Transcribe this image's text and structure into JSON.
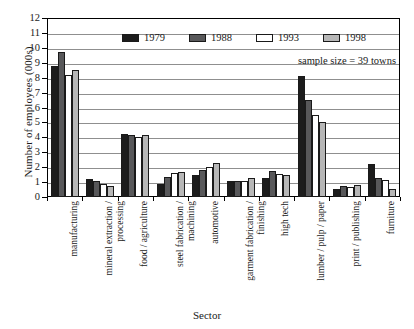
{
  "chart_data": {
    "type": "bar",
    "title": "",
    "xlabel": "Sector",
    "ylabel": "Number of employees (000s)",
    "ylim": [
      0,
      12
    ],
    "ytick_step": 1,
    "yticks": [
      "0",
      "1",
      "2",
      "3",
      "4",
      "5",
      "6",
      "7",
      "8",
      "9",
      "10",
      "11",
      "12"
    ],
    "grid": true,
    "legend_position": "top-center",
    "annotation": "sample size = 39 towns",
    "categories": [
      "manufacturing",
      "mineral extraction / processing",
      "food / agriculture",
      "steel fabrication / machining",
      "automotive",
      "garment fabrication / finishing",
      "high tech",
      "lumber / pulp / paper",
      "print / publishing",
      "furniture"
    ],
    "category_lines": [
      [
        "manufacturing",
        ""
      ],
      [
        "mineral extraction /",
        "processing"
      ],
      [
        "food / agriculture",
        ""
      ],
      [
        "steel fabrication /",
        "machining"
      ],
      [
        "automotive",
        ""
      ],
      [
        "garment fabrication /",
        "finishing"
      ],
      [
        "high tech",
        ""
      ],
      [
        "lumber / pulp / paper",
        ""
      ],
      [
        "print / publishing",
        ""
      ],
      [
        "furniture",
        ""
      ]
    ],
    "series": [
      {
        "name": "1979",
        "color": "#1c1c1c",
        "values": [
          8.8,
          1.2,
          4.25,
          0.9,
          1.5,
          1.1,
          1.25,
          8.1,
          0.55,
          2.2
        ]
      },
      {
        "name": "1988",
        "color": "#58585a",
        "values": [
          9.7,
          1.05,
          4.15,
          1.35,
          1.8,
          1.1,
          1.75,
          6.5,
          0.75,
          1.3
        ]
      },
      {
        "name": "1993",
        "color": "#ffffff",
        "values": [
          8.2,
          0.85,
          4.0,
          1.6,
          2.0,
          1.1,
          1.55,
          5.5,
          0.7,
          1.15
        ]
      },
      {
        "name": "1998",
        "color": "#b7b7b7",
        "values": [
          8.5,
          0.75,
          4.15,
          1.7,
          2.25,
          1.25,
          1.5,
          5.0,
          0.8,
          0.55
        ]
      }
    ]
  }
}
